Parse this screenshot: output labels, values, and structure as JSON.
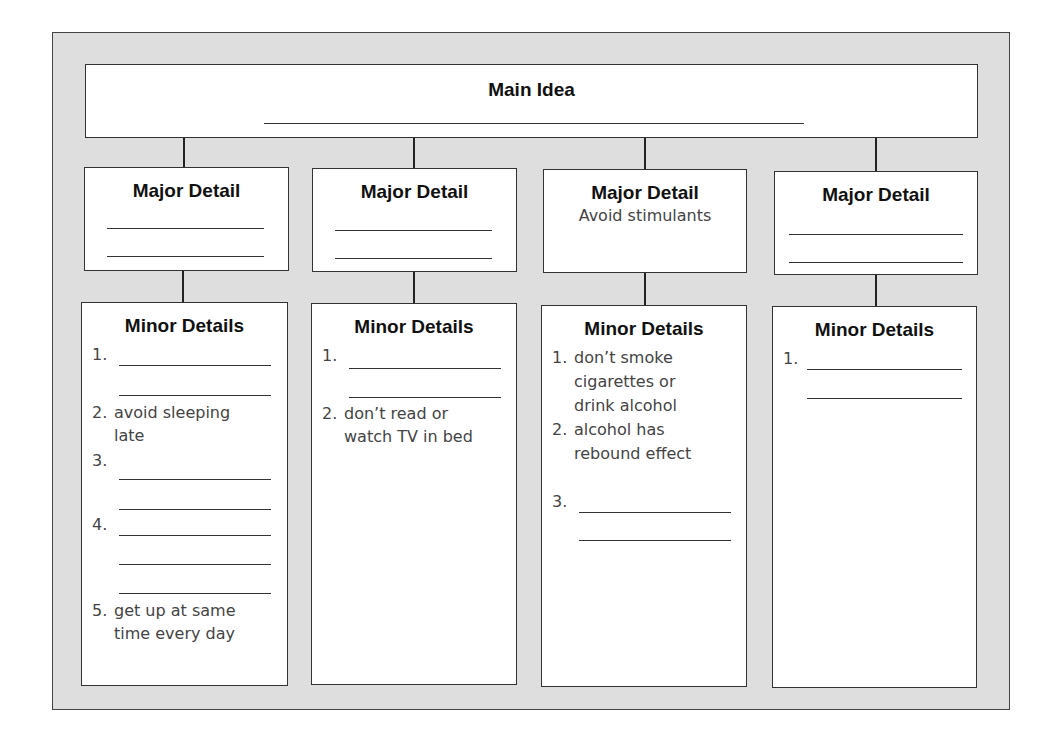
{
  "main_idea": {
    "label": "Main Idea",
    "value": ""
  },
  "columns": [
    {
      "major_label": "Major Detail",
      "major_value": "",
      "minor_label": "Minor Details",
      "minor_items": [
        {
          "num": "1.",
          "text": ""
        },
        {
          "num": "2.",
          "text": "avoid sleeping late"
        },
        {
          "num": "3.",
          "text": ""
        },
        {
          "num": "4.",
          "text": ""
        },
        {
          "num": "5.",
          "text": "get up at same time every day"
        }
      ]
    },
    {
      "major_label": "Major Detail",
      "major_value": "",
      "minor_label": "Minor Details",
      "minor_items": [
        {
          "num": "1.",
          "text": ""
        },
        {
          "num": "2.",
          "text": "don’t read or watch TV in bed"
        }
      ]
    },
    {
      "major_label": "Major Detail",
      "major_value": "Avoid stimulants",
      "minor_label": "Minor Details",
      "minor_items": [
        {
          "num": "1.",
          "text": "don’t smoke cigarettes or drink alcohol"
        },
        {
          "num": "2.",
          "text": "alcohol has rebound effect"
        },
        {
          "num": "3.",
          "text": ""
        }
      ]
    },
    {
      "major_label": "Major Detail",
      "major_value": "",
      "minor_label": "Minor Details",
      "minor_items": [
        {
          "num": "1.",
          "text": ""
        }
      ]
    }
  ],
  "display_lines": {
    "c0_i1_l1": "avoid sleeping",
    "c0_i1_l2": "late",
    "c0_i4_l1": "get up at same",
    "c0_i4_l2": "time every day",
    "c1_i1_l1": "don’t read or",
    "c1_i1_l2": "watch TV in bed",
    "c2_i0_l1": "don’t smoke",
    "c2_i0_l2": "cigarettes or",
    "c2_i0_l3": "drink alcohol",
    "c2_i1_l1": "alcohol has",
    "c2_i1_l2": "rebound effect"
  }
}
